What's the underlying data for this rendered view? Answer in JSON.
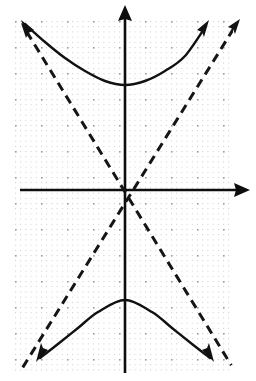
{
  "figure": {
    "background_color": "#ffffff",
    "width": 256,
    "height": 381
  },
  "grid": {
    "label": "dotted-grid",
    "minor_spacing_px": 5.2,
    "major_spacing_px": 26,
    "minor_dot_color": "#c9c9c9",
    "major_dot_color": "#9a9a9a",
    "left_px": 15,
    "top_px": 21,
    "right_px": 233,
    "bottom_px": 373,
    "grid_on": true
  },
  "axes": {
    "origin_px": {
      "x": 125,
      "y": 190
    },
    "x_axis": {
      "name": "x-axis",
      "start_px": {
        "x": 20,
        "y": 190
      },
      "end_px": {
        "x": 250,
        "y": 190
      },
      "arrowheads": "right",
      "color": "#0d0d0d"
    },
    "y_axis": {
      "name": "y-axis",
      "start_px": {
        "x": 125,
        "y": 373
      },
      "end_px": {
        "x": 125,
        "y": 5
      },
      "arrowheads": "up",
      "color": "#0d0d0d"
    },
    "tick_labels": [],
    "axis_labels": {
      "x": "",
      "y": ""
    }
  },
  "chart_data": {
    "type": "line",
    "title": "",
    "subtitle": "",
    "xlabel": "",
    "ylabel": "",
    "grid": true,
    "legend": "none",
    "equation": "y^2/a^2 - x^2/b^2 = 1",
    "orientation": "vertical-transverse-axis",
    "center": {
      "x": 0,
      "y": 0
    },
    "a_units": 4,
    "b_units": 2.1,
    "units_per_major_gridline": 1,
    "px_per_unit": 26,
    "vertices_units": [
      {
        "x": 0,
        "y": 4
      },
      {
        "x": 0,
        "y": -4
      }
    ],
    "vertices_px": [
      {
        "x": 125,
        "y": 85
      },
      {
        "x": 125,
        "y": 300
      }
    ],
    "asymptote_slopes": [
      1.9,
      -1.9
    ],
    "series": [
      {
        "name": "upper-branch",
        "style": "solid",
        "color": "#111111",
        "arrowheads": "both",
        "points_px": [
          {
            "x": 25,
            "y": 24
          },
          {
            "x": 45,
            "y": 42
          },
          {
            "x": 65,
            "y": 58
          },
          {
            "x": 85,
            "y": 71
          },
          {
            "x": 105,
            "y": 81
          },
          {
            "x": 125,
            "y": 85
          },
          {
            "x": 145,
            "y": 81
          },
          {
            "x": 165,
            "y": 71
          },
          {
            "x": 185,
            "y": 56
          },
          {
            "x": 206,
            "y": 26
          }
        ]
      },
      {
        "name": "lower-branch",
        "style": "solid",
        "color": "#111111",
        "arrowheads": "both",
        "points_px": [
          {
            "x": 40,
            "y": 358
          },
          {
            "x": 58,
            "y": 344
          },
          {
            "x": 78,
            "y": 328
          },
          {
            "x": 98,
            "y": 312
          },
          {
            "x": 125,
            "y": 300
          },
          {
            "x": 152,
            "y": 312
          },
          {
            "x": 172,
            "y": 328
          },
          {
            "x": 192,
            "y": 344
          },
          {
            "x": 210,
            "y": 358
          }
        ]
      },
      {
        "name": "asymptote-positive-slope",
        "style": "dashed",
        "color": "#151515",
        "arrowheads": "upper-right",
        "endpoints_px": [
          {
            "x": 18,
            "y": 375
          },
          {
            "x": 239,
            "y": 20
          }
        ]
      },
      {
        "name": "asymptote-negative-slope",
        "style": "dashed",
        "color": "#151515",
        "arrowheads": "upper-left",
        "endpoints_px": [
          {
            "x": 22,
            "y": 24
          },
          {
            "x": 236,
            "y": 373
          }
        ]
      }
    ],
    "annotations": []
  }
}
